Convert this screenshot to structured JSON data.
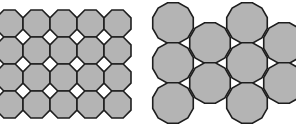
{
  "figure": {
    "panels": [
      {
        "id": "octagon-square-tiling",
        "description": "Truncated square tiling: gray octagons with small white squares at vertices",
        "tile_fill": "#b4b4b4",
        "gap_fill": "#ffffff",
        "stroke": "#1e1e1e",
        "cols": 5,
        "rows": 4,
        "cell": 27,
        "origin_x": -4,
        "origin_y": 10
      },
      {
        "id": "dodecagon-triangle-tiling",
        "description": "Truncated hexagonal tiling: gray dodecagons with small white triangles",
        "tile_fill": "#b4b4b4",
        "gap_fill": "#ffffff",
        "stroke": "#1e1e1e",
        "radius": 21,
        "columns": [
          {
            "cx": 173,
            "cys": [
              23,
              63,
              103
            ]
          },
          {
            "cx": 210,
            "cys": [
              43,
              83
            ]
          },
          {
            "cx": 247,
            "cys": [
              23,
              63,
              103
            ]
          },
          {
            "cx": 284,
            "cys": [
              43,
              83
            ]
          }
        ]
      }
    ]
  }
}
